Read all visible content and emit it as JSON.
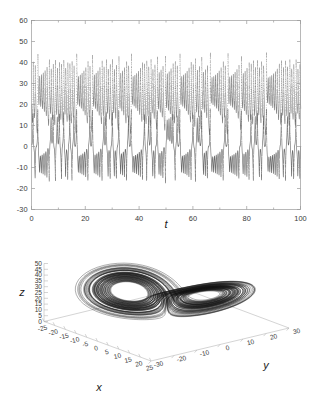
{
  "figure": {
    "name": "lorenz-system-figure",
    "background": "#ffffff",
    "trace_color": "#4a4a4a",
    "axis_color": "#9a9a9a"
  },
  "chart_data": [
    {
      "id": "timeseries",
      "type": "line",
      "title": "",
      "subtitle": "",
      "xlabel": "t",
      "ylabel": "",
      "xlim": [
        0,
        100
      ],
      "ylim": [
        -30,
        60
      ],
      "grid": false,
      "legend": null,
      "xticks": [
        0,
        20,
        40,
        60,
        80,
        100
      ],
      "xticklabels": [
        "0",
        "20",
        "40",
        "60",
        "80",
        "100"
      ],
      "yticks": [
        -30,
        -20,
        -10,
        0,
        10,
        20,
        30,
        40,
        50,
        60
      ],
      "yticklabels": [
        "-30",
        "-20",
        "-10",
        "0",
        "10",
        "20",
        "30",
        "40",
        "50",
        "60"
      ],
      "minor_xticks": [
        10,
        30,
        50,
        70,
        90
      ],
      "marker": "dots",
      "series": [
        {
          "name": "x(t)",
          "description": "Lorenz x-coordinate, oscillating between about -23 and +20, lobe-switching chaotic signal",
          "color": "#4a4a4a",
          "envelope_min": -23,
          "envelope_max": 20,
          "mean": -1
        },
        {
          "name": "z(t)",
          "description": "Lorenz z-coordinate, oscillating between about 19 and 48, always positive",
          "color": "#6a6a6a",
          "envelope_min": 19,
          "envelope_max": 48,
          "mean": 30
        }
      ],
      "annotations": [
        {
          "t": 26,
          "note": "lobe-switch burst, x reaches -25"
        },
        {
          "t": 40,
          "note": "lobe-switch burst"
        },
        {
          "t": 48,
          "note": "lobe-switch burst"
        },
        {
          "t": 75,
          "note": "lobe-switch burst"
        }
      ]
    },
    {
      "id": "attractor",
      "type": "line",
      "title": "",
      "xlabel": "x",
      "ylabel": "y",
      "zlabel": "z",
      "projection": "3d",
      "grid": false,
      "legend": null,
      "xlim": [
        -25,
        25
      ],
      "ylim": [
        -30,
        30
      ],
      "zlim": [
        0,
        50
      ],
      "xticks": [
        -25,
        -20,
        -15,
        -10,
        -5,
        0,
        5,
        10,
        15,
        20,
        25
      ],
      "xticklabels": [
        "-25",
        "-20",
        "-15",
        "-10",
        "-5",
        "0",
        "5",
        "10",
        "15",
        "20",
        "25"
      ],
      "yticks": [
        -30,
        -20,
        -10,
        0,
        10,
        20,
        30
      ],
      "yticklabels": [
        "-30",
        "-20",
        "-10",
        "0",
        "10",
        "20",
        "30"
      ],
      "zticks": [
        0,
        5,
        10,
        15,
        20,
        25,
        30,
        35,
        40,
        45,
        50
      ],
      "zticklabels": [
        "0",
        "5",
        "10",
        "15",
        "20",
        "25",
        "30",
        "35",
        "40",
        "45",
        "50"
      ],
      "series": [
        {
          "name": "Lorenz attractor trajectory",
          "description": "Butterfly-shaped strange attractor with two lobes, dense spiralling orbits",
          "color": "#111111"
        }
      ]
    }
  ]
}
